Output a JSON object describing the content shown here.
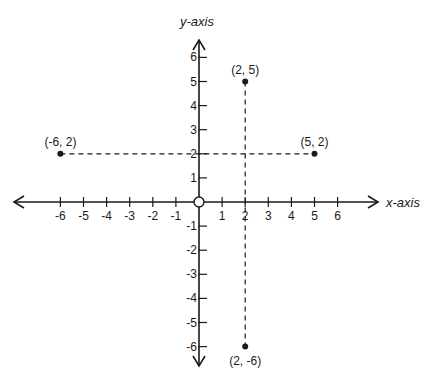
{
  "chart_data": {
    "type": "scatter",
    "title": "",
    "xlabel": "x-axis",
    "ylabel": "y-axis",
    "xlim": [
      -6,
      6
    ],
    "ylim": [
      -6,
      6
    ],
    "grid": false,
    "x_ticks": [
      -6,
      -5,
      -4,
      -3,
      -2,
      -1,
      1,
      2,
      3,
      4,
      5,
      6
    ],
    "y_ticks": [
      -6,
      -5,
      -4,
      -3,
      -2,
      -1,
      1,
      2,
      3,
      4,
      5,
      6
    ],
    "origin_marker": "open-circle",
    "points": [
      {
        "x": -6,
        "y": 2,
        "label": "(-6, 2)"
      },
      {
        "x": 5,
        "y": 2,
        "label": "(5, 2)"
      },
      {
        "x": 2,
        "y": 5,
        "label": "(2, 5)"
      },
      {
        "x": 2,
        "y": -6,
        "label": "(2, -6)"
      }
    ],
    "dashed_lines": [
      {
        "from": [
          -6,
          2
        ],
        "to": [
          5,
          2
        ]
      },
      {
        "from": [
          2,
          5
        ],
        "to": [
          2,
          -6
        ]
      }
    ],
    "colors": {
      "ink": "#1a1a1a",
      "background": "#ffffff"
    }
  }
}
